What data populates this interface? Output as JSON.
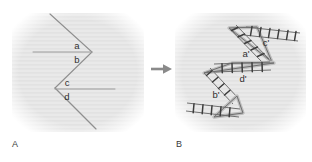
{
  "figure": {
    "panels": [
      {
        "id": "A",
        "label": "A",
        "caption_position": "bottom-left",
        "description": "Two opposing V-shaped bent lines with horizontal reference lines, angles labelled a, b, c, d",
        "angle_labels": [
          {
            "name": "a",
            "text": "a"
          },
          {
            "name": "b",
            "text": "b"
          },
          {
            "name": "c",
            "text": "c"
          },
          {
            "name": "d",
            "text": "d"
          }
        ]
      },
      {
        "id": "B",
        "label": "B",
        "caption_position": "bottom-left",
        "description": "Same bent-line geometry redrawn as hatched ladder bands with wedge vertices, angles labelled a-prime, b-prime, c-prime, d-prime",
        "angle_labels": [
          {
            "name": "a-prime",
            "text": "a'"
          },
          {
            "name": "b-prime",
            "text": "b'"
          },
          {
            "name": "c-prime",
            "text": "c'"
          },
          {
            "name": "d-prime",
            "text": "d'"
          }
        ]
      }
    ],
    "transition": {
      "name": "arrow-right",
      "glyph": "→"
    },
    "colors": {
      "panel_background": "#e8e8e8",
      "line": "#8c8c8c",
      "ladder_line": "#6f6f6f",
      "rung": "#3c3c3c",
      "halo": "#c9c9c9",
      "label_text": "#2f2f2f",
      "panel_label_text": "#3a3a3a",
      "arrow": "#8a8a8a"
    }
  }
}
